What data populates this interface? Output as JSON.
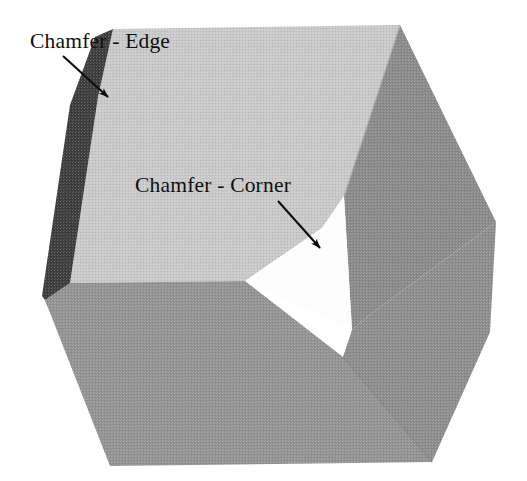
{
  "figure": {
    "kind": "3d-solid-illustration",
    "background_color": "#ffffff",
    "canvas": {
      "width": 527,
      "height": 481
    },
    "render_style": "grayscale halftone / dithered raster scan"
  },
  "annotations": [
    {
      "id": "chamfer-edge",
      "label": "Chamfer - Edge",
      "text_x": 30,
      "text_y": 48,
      "font_size": 21.5,
      "color": "#101010",
      "leader": {
        "from_x": 63,
        "from_y": 56,
        "to_x": 108,
        "to_y": 97,
        "head_angle_deg": 42
      },
      "points_to": "dark narrow chamfer strip along upper-left silhouette"
    },
    {
      "id": "chamfer-corner",
      "label": "Chamfer - Corner",
      "text_x": 135,
      "text_y": 192,
      "font_size": 21.5,
      "color": "#101010",
      "leader": {
        "from_x": 278,
        "from_y": 201,
        "to_x": 320,
        "to_y": 248,
        "head_angle_deg": 48
      },
      "points_to": "white triangular chamfered corner facet"
    }
  ],
  "faces": [
    {
      "id": "top-face",
      "name": "top-face",
      "description": "Large light-gray upper face of the solid",
      "color": "#c9c9c9",
      "points": "113,29 400,25 344,196 322,228 245,281 70,283 98,97"
    },
    {
      "id": "chamfer-edge-face",
      "name": "chamfer-edge-face",
      "description": "Narrow dark chamfer band running down the left silhouette",
      "color": "#3d3d3d",
      "points": "113,29 98,97 70,283 45,300 42,296 70,105 95,37"
    },
    {
      "id": "chamfer-edge-face-lower",
      "name": "chamfer-edge-face-lower",
      "description": "Lower continuation of the dark chamfer band",
      "color": "#4a4a4a",
      "points": "70,283 45,300 48,307 74,292"
    },
    {
      "id": "bottom-left-face",
      "name": "bottom-left-face",
      "description": "Medium-gray lower-left face",
      "color": "#939393",
      "points": "70,283 245,281 343,357 432,462 110,466 45,300"
    },
    {
      "id": "bottom-right-face",
      "name": "bottom-right-face",
      "description": "Medium-gray lower-right face of the solid",
      "color": "#8d8d8d",
      "points": "343,357 352,330 368,316 496,222 490,332 432,462"
    },
    {
      "id": "right-face",
      "name": "right-face",
      "description": "Darker gray right-hand face",
      "color": "#8a8a8a",
      "points": "400,25 496,222 368,316 352,330 344,196"
    },
    {
      "id": "chamfer-corner-face",
      "name": "chamfer-corner-face",
      "description": "White triangular chamfered corner facet",
      "color": "#fdfdfd",
      "points": "344,196 352,330 245,281 322,228"
    }
  ],
  "edges": [
    {
      "id": "top-to-right-crease",
      "name": "top-right-crease",
      "color": "#b0b0b0",
      "x1": 400,
      "y1": 25,
      "x2": 344,
      "y2": 196
    },
    {
      "id": "bottom-crease",
      "name": "bottom-faces-crease",
      "color": "#868686",
      "x1": 343,
      "y1": 357,
      "x2": 432,
      "y2": 462
    }
  ],
  "palette": {
    "background": "#ffffff",
    "top_face": "#c9c9c9",
    "chamfer_edge_dark": "#3d3d3d",
    "bottom_left_face": "#939393",
    "bottom_right_face": "#8d8d8d",
    "right_face": "#8a8a8a",
    "chamfer_corner_white": "#fdfdfd",
    "text": "#101010"
  }
}
